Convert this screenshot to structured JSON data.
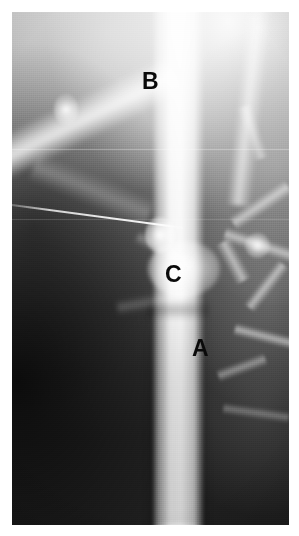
{
  "image": {
    "modality": "venogram",
    "description": "Grayscale contrast venogram radiograph with three lettered annotations",
    "border_color": "#ffffff",
    "background_color": "#1d1d1d",
    "contrast_color": "#ffffff",
    "annotation_color": "#0a0a0a"
  },
  "annotations": [
    {
      "id": "a",
      "label": "A",
      "x": 205,
      "y": 349,
      "meaning": "main opacified vein trunk"
    },
    {
      "id": "b",
      "label": "B",
      "x": 155,
      "y": 82,
      "meaning": "oblique branch vein"
    },
    {
      "id": "c",
      "label": "C",
      "x": 177,
      "y": 275,
      "meaning": "junction / stenosis site"
    }
  ],
  "features": {
    "main_vessel": "vertical bright contrast-filled vein",
    "branch_vessel": "oblique branch entering from upper left",
    "catheter": "thin oblique guide-wire crossing left field",
    "collaterals": "network of small collateral veins on right",
    "stenosis": "focal bulge and waist at level C"
  }
}
